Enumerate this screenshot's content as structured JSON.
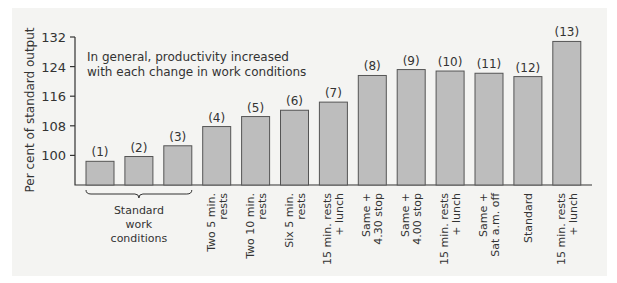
{
  "chart_data": {
    "type": "bar",
    "title": "",
    "annotation": [
      "In general, productivity increased",
      "with each change in work conditions"
    ],
    "xlabel": "",
    "ylabel": "Per cent of standard output",
    "ylim": [
      92,
      132
    ],
    "yticks": [
      100,
      108,
      116,
      124,
      132
    ],
    "grid": false,
    "legend": null,
    "bar_ids": [
      "(1)",
      "(2)",
      "(3)",
      "(4)",
      "(5)",
      "(6)",
      "(7)",
      "(8)",
      "(9)",
      "(10)",
      "(11)",
      "(12)",
      "(13)"
    ],
    "categories": [
      "Standard work conditions",
      "Standard work conditions",
      "Standard work conditions",
      "Two 5 min. rests",
      "Two 10 min. rests",
      "Six 5 min. rests",
      "15 min. rests + lunch",
      "Same + 4.30 stop",
      "Same + 4.00 stop",
      "15 min. rests + lunch",
      "Same + Sat a.m. off",
      "Standard",
      "15 min. rests + lunch"
    ],
    "values": [
      98.4,
      99.7,
      102.6,
      107.8,
      110.5,
      112.2,
      114.4,
      121.6,
      123.2,
      122.8,
      122.2,
      121.3,
      130.8
    ],
    "group_label": [
      "Standard",
      "work",
      "conditions"
    ],
    "rotated_labels": [
      [
        "Two 5 min.",
        "rests"
      ],
      [
        "Two 10 min.",
        "rests"
      ],
      [
        "Six 5 min.",
        "rests"
      ],
      [
        "15 min. rests",
        "+ lunch"
      ],
      [
        "Same +",
        "4.30 stop"
      ],
      [
        "Same +",
        "4.00 stop"
      ],
      [
        "15 min. rests",
        "+ lunch"
      ],
      [
        "Same +",
        "Sat a.m. off"
      ],
      [
        "Standard"
      ],
      [
        "15 min. rests",
        "+ lunch"
      ]
    ]
  }
}
